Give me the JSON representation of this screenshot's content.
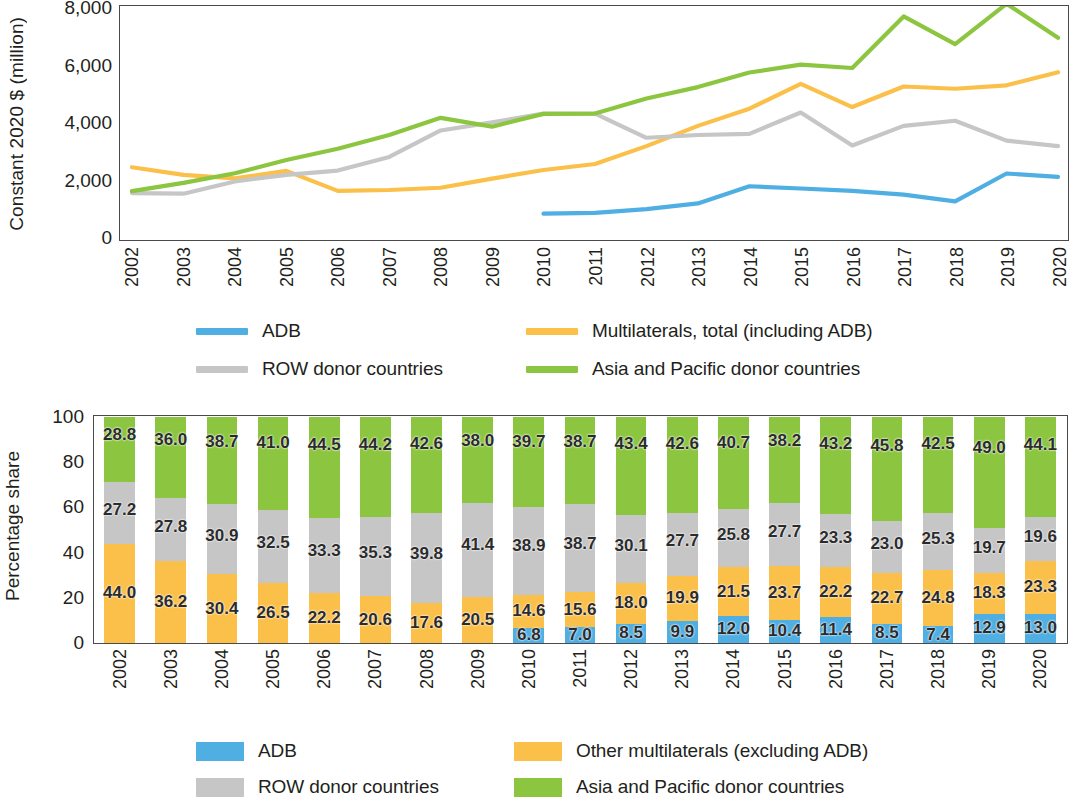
{
  "colors": {
    "adb": "#4FAFE3",
    "multilaterals": "#FBC04A",
    "row": "#C6C6C6",
    "asia_pacific": "#8CC640",
    "axis": "#4a4a4a",
    "text": "#231f20"
  },
  "line_chart": {
    "y_axis_title": "Constant 2020 $ (million)",
    "y_ticks": [
      "0",
      "2,000",
      "4,000",
      "6,000",
      "8,000"
    ],
    "legend": [
      {
        "label": "ADB",
        "color_key": "adb",
        "icon": "line-swatch"
      },
      {
        "label": "Multilaterals, total (including ADB)",
        "color_key": "multilaterals",
        "icon": "line-swatch"
      },
      {
        "label": "ROW donor countries",
        "color_key": "row",
        "icon": "line-swatch"
      },
      {
        "label": "Asia and Pacific donor countries",
        "color_key": "asia_pacific",
        "icon": "line-swatch"
      }
    ]
  },
  "bar_chart": {
    "y_axis_title": "Percentage share",
    "y_ticks": [
      "0",
      "20",
      "40",
      "60",
      "80",
      "100"
    ],
    "legend": [
      {
        "label": "ADB",
        "color_key": "adb",
        "icon": "box-swatch"
      },
      {
        "label": "Other multilaterals (excluding ADB)",
        "color_key": "multilaterals",
        "icon": "box-swatch"
      },
      {
        "label": "ROW donor countries",
        "color_key": "row",
        "icon": "box-swatch"
      },
      {
        "label": "Asia and Pacific donor countries",
        "color_key": "asia_pacific",
        "icon": "box-swatch"
      }
    ]
  },
  "chart_data": [
    {
      "type": "line",
      "title": "",
      "xlabel": "",
      "ylabel": "Constant 2020 $ (million)",
      "ylim": [
        0,
        8000
      ],
      "ytick_values": [
        0,
        2000,
        4000,
        6000,
        8000
      ],
      "grid": false,
      "legend_position": "bottom",
      "x": [
        2002,
        2003,
        2004,
        2005,
        2006,
        2007,
        2008,
        2009,
        2010,
        2011,
        2012,
        2013,
        2014,
        2015,
        2016,
        2017,
        2018,
        2019,
        2020
      ],
      "series": [
        {
          "name": "ADB",
          "color": "#4FAFE3",
          "values": [
            null,
            null,
            null,
            null,
            null,
            null,
            null,
            null,
            820,
            850,
            980,
            1180,
            1780,
            1700,
            1620,
            1490,
            1250,
            2230,
            2110
          ]
        },
        {
          "name": "Multilaterals, total (including ADB)",
          "color": "#FBC04A",
          "values": [
            2450,
            2180,
            2060,
            2320,
            1620,
            1650,
            1730,
            2050,
            2350,
            2560,
            3190,
            3900,
            4500,
            5370,
            4560,
            5280,
            5200,
            5320,
            5780
          ]
        },
        {
          "name": "ROW donor countries",
          "color": "#C6C6C6",
          "values": [
            1540,
            1520,
            1950,
            2180,
            2330,
            2810,
            3740,
            4020,
            4330,
            4330,
            3480,
            3580,
            3620,
            4370,
            3210,
            3900,
            4080,
            3380,
            3190
          ]
        },
        {
          "name": "Asia and Pacific donor countries",
          "color": "#8CC640",
          "values": [
            1610,
            1900,
            2240,
            2700,
            3100,
            3580,
            4180,
            3870,
            4320,
            4330,
            4860,
            5260,
            5770,
            6050,
            5930,
            7740,
            6770,
            8180,
            6990
          ]
        }
      ]
    },
    {
      "type": "bar",
      "stacked": true,
      "title": "",
      "xlabel": "",
      "ylabel": "Percentage share",
      "ylim": [
        0,
        100
      ],
      "ytick_values": [
        0,
        20,
        40,
        60,
        80,
        100
      ],
      "grid": false,
      "legend_position": "bottom",
      "categories": [
        "2002",
        "2003",
        "2004",
        "2005",
        "2006",
        "2007",
        "2008",
        "2009",
        "2010",
        "2011",
        "2012",
        "2013",
        "2014",
        "2015",
        "2016",
        "2017",
        "2018",
        "2019",
        "2020"
      ],
      "series": [
        {
          "name": "ADB",
          "color": "#4FAFE3",
          "values": [
            null,
            null,
            null,
            null,
            null,
            null,
            null,
            null,
            6.8,
            7.0,
            8.5,
            9.9,
            12.0,
            10.4,
            11.4,
            8.5,
            7.4,
            12.9,
            13.0
          ],
          "labels": [
            "",
            "",
            "",
            "",
            "",
            "",
            "",
            "",
            "6.8",
            "7.0",
            "8.5",
            "9.9",
            "12.0",
            "10.4",
            "11.4",
            "8.5",
            "7.4",
            "12.9",
            "13.0"
          ]
        },
        {
          "name": "Other multilaterals (excluding ADB)",
          "color": "#FBC04A",
          "values": [
            44.0,
            36.2,
            30.4,
            26.5,
            22.2,
            20.6,
            17.6,
            20.5,
            14.6,
            15.6,
            18.0,
            19.9,
            21.5,
            23.7,
            22.2,
            22.7,
            24.8,
            18.3,
            23.3
          ],
          "labels": [
            "44.0",
            "36.2",
            "30.4",
            "26.5",
            "22.2",
            "20.6",
            "17.6",
            "20.5",
            "14.6",
            "15.6",
            "18.0",
            "19.9",
            "21.5",
            "23.7",
            "22.2",
            "22.7",
            "24.8",
            "18.3",
            "23.3"
          ]
        },
        {
          "name": "ROW donor countries",
          "color": "#C6C6C6",
          "values": [
            27.2,
            27.8,
            30.9,
            32.5,
            33.3,
            35.3,
            39.8,
            41.4,
            38.9,
            38.7,
            30.1,
            27.7,
            25.8,
            27.7,
            23.3,
            23.0,
            25.3,
            19.7,
            19.6
          ],
          "labels": [
            "27.2",
            "27.8",
            "30.9",
            "32.5",
            "33.3",
            "35.3",
            "39.8",
            "41.4",
            "38.9",
            "38.7",
            "30.1",
            "27.7",
            "25.8",
            "27.7",
            "23.3",
            "23.0",
            "25.3",
            "19.7",
            "19.6"
          ]
        },
        {
          "name": "Asia and Pacific donor countries",
          "color": "#8CC640",
          "values": [
            28.8,
            36.0,
            38.7,
            41.0,
            44.5,
            44.2,
            42.6,
            38.0,
            39.7,
            38.7,
            43.4,
            42.6,
            40.7,
            38.2,
            43.2,
            45.8,
            42.5,
            49.0,
            44.1
          ],
          "labels": [
            "28.8",
            "36.0",
            "38.7",
            "41.0",
            "44.5",
            "44.2",
            "42.6",
            "38.0",
            "39.7",
            "38.7",
            "43.4",
            "42.6",
            "40.7",
            "38.2",
            "43.2",
            "45.8",
            "42.5",
            "49.0",
            "44.1"
          ]
        }
      ]
    }
  ]
}
